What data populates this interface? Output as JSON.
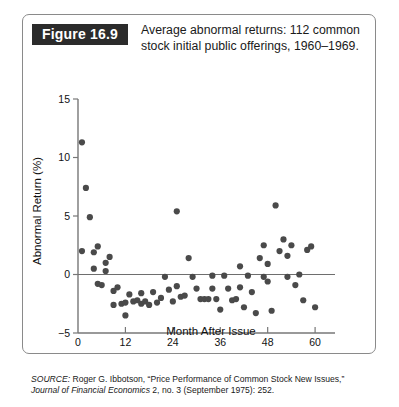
{
  "figure": {
    "tag": "Figure 16.9",
    "caption": "Average abnormal returns: 112 common stock initial public offerings, 1960–1969."
  },
  "source": {
    "label": "SOURCE:",
    "line1_rest": " Roger G. Ibbotson, “Price Performance of Common Stock New Issues,”",
    "journal": "Journal of Financial Economics",
    "line2_rest": " 2, no. 3 (September 1975): 252."
  },
  "chart_data": {
    "type": "scatter",
    "title": "Average abnormal returns: 112 common stock initial public offerings, 1960–1969.",
    "xlabel": "Month After Issue",
    "ylabel": "Abnormal Return (%)",
    "xlim": [
      0,
      62
    ],
    "ylim": [
      -5,
      15
    ],
    "xticks": [
      0,
      12,
      24,
      36,
      48,
      60
    ],
    "xtick_labels": [
      "0",
      "12",
      "24",
      "36",
      "48",
      "60"
    ],
    "yticks": [
      -5,
      0,
      5,
      10,
      15
    ],
    "ytick_labels": [
      "−5",
      "0",
      "5",
      "10",
      "15"
    ],
    "grid": false,
    "legend": null,
    "zero_reference_line": 0,
    "marker_color": "#4a4a4a",
    "marker_radius_px": 3.1,
    "points": [
      [
        1,
        11.3
      ],
      [
        1,
        2.0
      ],
      [
        2,
        7.4
      ],
      [
        3,
        4.9
      ],
      [
        4,
        0.5
      ],
      [
        5,
        -0.8
      ],
      [
        6,
        -0.9
      ],
      [
        5,
        2.4
      ],
      [
        4,
        1.9
      ],
      [
        7,
        1.0
      ],
      [
        8,
        1.5
      ],
      [
        7,
        0.3
      ],
      [
        9,
        -1.4
      ],
      [
        9,
        -2.6
      ],
      [
        10,
        -1.1
      ],
      [
        11,
        -2.5
      ],
      [
        12,
        -2.4
      ],
      [
        12,
        -3.5
      ],
      [
        13,
        -1.7
      ],
      [
        14,
        -2.3
      ],
      [
        15,
        -2.2
      ],
      [
        16,
        -1.6
      ],
      [
        16,
        -2.5
      ],
      [
        17,
        -2.3
      ],
      [
        18,
        -2.6
      ],
      [
        19,
        -1.5
      ],
      [
        20,
        -2.4
      ],
      [
        21,
        -2.0
      ],
      [
        22,
        -0.2
      ],
      [
        23,
        -1.3
      ],
      [
        24,
        -2.3
      ],
      [
        25,
        5.4
      ],
      [
        25,
        -1.0
      ],
      [
        26,
        -1.9
      ],
      [
        27,
        -1.8
      ],
      [
        28,
        1.4
      ],
      [
        29,
        -0.2
      ],
      [
        30,
        -1.2
      ],
      [
        31,
        -2.1
      ],
      [
        32,
        -2.1
      ],
      [
        33,
        -2.1
      ],
      [
        34,
        -0.1
      ],
      [
        34,
        -1.2
      ],
      [
        35,
        -2.1
      ],
      [
        36,
        -3.0
      ],
      [
        37,
        -0.1
      ],
      [
        38,
        -1.2
      ],
      [
        39,
        -2.2
      ],
      [
        40,
        -2.1
      ],
      [
        41,
        0.7
      ],
      [
        41,
        -1.1
      ],
      [
        42,
        -2.8
      ],
      [
        43,
        -0.1
      ],
      [
        44,
        -1.5
      ],
      [
        45,
        -3.3
      ],
      [
        46,
        1.4
      ],
      [
        47,
        2.5
      ],
      [
        47,
        -0.2
      ],
      [
        48,
        0.9
      ],
      [
        48,
        -0.6
      ],
      [
        49,
        -3.1
      ],
      [
        50,
        5.9
      ],
      [
        51,
        2.0
      ],
      [
        52,
        3.0
      ],
      [
        53,
        1.6
      ],
      [
        53,
        -0.2
      ],
      [
        54,
        2.5
      ],
      [
        55,
        -0.9
      ],
      [
        56,
        0.0
      ],
      [
        57,
        -2.2
      ],
      [
        58,
        2.1
      ],
      [
        59,
        2.4
      ],
      [
        60,
        -2.8
      ]
    ]
  }
}
